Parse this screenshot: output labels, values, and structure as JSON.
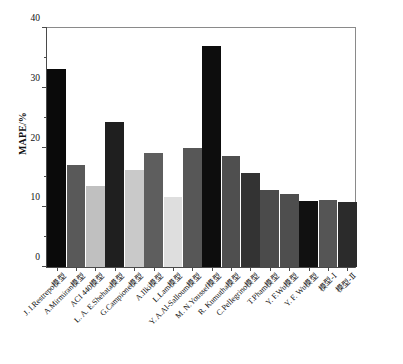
{
  "chart_data": {
    "type": "bar",
    "title": "",
    "xlabel": "",
    "ylabel": "MAPE/%",
    "ylim": [
      0,
      40
    ],
    "ytick_labels": [
      "0",
      "10",
      "20",
      "30",
      "40"
    ],
    "ytick_values": [
      0,
      10,
      20,
      30,
      40
    ],
    "yminor_values": [
      5,
      15,
      25,
      35
    ],
    "grid": false,
    "legend": "none",
    "categories": [
      "J. I.Restrepo模型",
      "A.Mirmiran模型",
      "ACI 440模型",
      "L. A. E.Shehata模型",
      "G.Campione模型",
      "A.Ilki模型",
      "L.Lam模型",
      "Y. A.Al-Salloum模型",
      "M. N.Youssef模型",
      "R. Kumutha模型",
      "C.Pellegrino模型",
      "T.Pham模型",
      "Y. F.Wu模型",
      "Y. F. Wu模型",
      "模型-Ⅰ",
      "模型-Ⅱ"
    ],
    "values": [
      32.8,
      17.0,
      13.4,
      24.1,
      16.1,
      19.0,
      11.7,
      19.8,
      36.7,
      18.5,
      15.6,
      12.7,
      12.2,
      10.9,
      11.1,
      10.8
    ],
    "bar_colors": [
      "#0a0a0a",
      "#595959",
      "#c0c0c0",
      "#1f1f1f",
      "#c9c9c9",
      "#5e5e5e",
      "#dedede",
      "#575757",
      "#0d0d0d",
      "#4f4f4f",
      "#333333",
      "#4b4b4b",
      "#4e4e4e",
      "#111111",
      "#555555",
      "#2b2b2b"
    ]
  },
  "axis": {
    "y_title": "MAPE/%"
  }
}
